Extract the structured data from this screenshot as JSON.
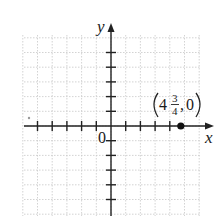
{
  "diagram": {
    "type": "coordinate-plane",
    "axes": {
      "x_label": "x",
      "y_label": "y",
      "origin_label": "0",
      "x_ticks": [
        -5,
        -4,
        -3,
        -2,
        -1,
        1,
        2,
        3,
        4
      ],
      "y_ticks": [
        -5,
        -4,
        -3,
        -2,
        -1,
        1,
        2,
        3,
        4,
        5
      ]
    },
    "grid": {
      "style": "dotted",
      "color": "#c8c8c8"
    },
    "point": {
      "x": 4.75,
      "y": 0,
      "label_open": "(",
      "label_whole": "4",
      "label_numerator": "3",
      "label_denominator": "4",
      "label_separator": ",",
      "label_y": "0",
      "label_close": ")",
      "color": "#111111"
    },
    "colors": {
      "axis": "#222222",
      "tick": "#222222"
    }
  }
}
